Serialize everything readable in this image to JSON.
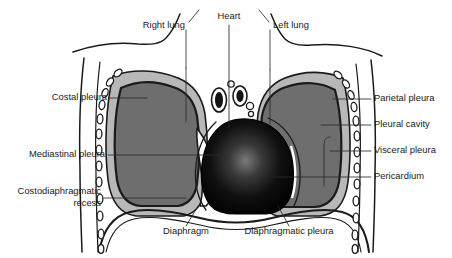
{
  "figure": {
    "background": "#ffffff",
    "width": 452,
    "height": 258
  },
  "colors": {
    "lung_fill": "#6e6e6e",
    "pleural_cavity_fill": "#b8b8b8",
    "heart_dark": "#050505",
    "heart_highlight": "#6a6a6a",
    "outline": "#1a1a1a",
    "leader": "#2b2b2b",
    "text": "#1a1a1a",
    "white": "#ffffff"
  },
  "labels": [
    {
      "id": "right-lung",
      "text": "Right lung",
      "x": 185,
      "y": 26,
      "anchor": "end"
    },
    {
      "id": "heart",
      "text": "Heart",
      "x": 229,
      "y": 17,
      "anchor": "mid"
    },
    {
      "id": "left-lung",
      "text": "Left lung",
      "x": 273,
      "y": 26,
      "anchor": "start"
    },
    {
      "id": "costal-pleura",
      "text": "Costal pleura",
      "x": 107,
      "y": 98,
      "anchor": "end"
    },
    {
      "id": "mediastinal-pleura",
      "text": "Mediastinal pleura",
      "x": 105,
      "y": 155,
      "anchor": "end"
    },
    {
      "id": "parietal-pleura",
      "text": "Parietal pleura",
      "x": 374,
      "y": 99,
      "anchor": "start"
    },
    {
      "id": "pleural-cavity",
      "text": "Pleural cavity",
      "x": 374,
      "y": 125,
      "anchor": "start"
    },
    {
      "id": "visceral-pleura",
      "text": "Visceral pleura",
      "x": 374,
      "y": 151,
      "anchor": "start"
    },
    {
      "id": "pericardium",
      "text": "Pericardium",
      "x": 374,
      "y": 177,
      "anchor": "start"
    },
    {
      "id": "diaphragm",
      "text": "Diaphragm",
      "x": 186,
      "y": 232,
      "anchor": "mid"
    },
    {
      "id": "diaphragmatic-pleura",
      "text": "Diaphragmatic pleura",
      "x": 289,
      "y": 232,
      "anchor": "mid"
    }
  ],
  "multiline_labels": [
    {
      "id": "costodiaphragmatic-recess",
      "lines": [
        "Costodiaphragmatic",
        "recess"
      ],
      "x": 101,
      "y": 198,
      "line_height": 12,
      "anchor": "end"
    }
  ],
  "anatomy": {
    "parts": [
      "right lung",
      "left lung",
      "heart",
      "diaphragm",
      "costal pleura",
      "mediastinal pleura",
      "diaphragmatic pleura",
      "parietal pleura",
      "visceral pleura",
      "pleural cavity",
      "pericardium",
      "costodiaphragmatic recess",
      "ribs",
      "great vessels"
    ]
  }
}
